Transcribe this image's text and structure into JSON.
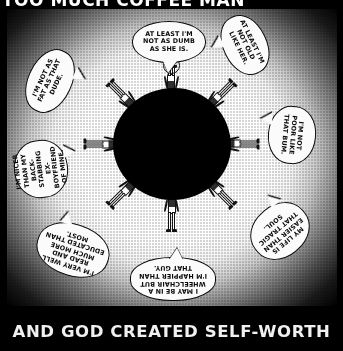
{
  "comic": {
    "title": "TOO MUCH COFFEE MAN",
    "byline": "BY SHANNON WHEELER",
    "caption": "AND GOD CREATED SELF-WORTH",
    "colors": {
      "ink": "#0a0a0a",
      "paper": "#fbfbfb",
      "background": "#000000",
      "glow": "#ffffff"
    }
  },
  "balloons": [
    {
      "id": "top",
      "position": "top-center",
      "text": "AT LEAST I'M NOT AS DUMB AS SHE IS.",
      "emphasis": "DUMB",
      "rotation_deg": 0
    },
    {
      "id": "topright",
      "position": "top-right",
      "text": "AT LEAST I'M NOT OLD LIKE HER.",
      "emphasis": "OLD",
      "rotation_deg": 64
    },
    {
      "id": "right",
      "position": "right",
      "text": "I'M NOT POOR LIKE THAT BUM.",
      "emphasis": "POOR",
      "rotation_deg": 95
    },
    {
      "id": "bottomright",
      "position": "bottom-right",
      "text": "MY LIFE IS EASIER THAN THAT TRAGIC SOUL.",
      "emphasis": "EASIER",
      "rotation_deg": 140
    },
    {
      "id": "bottom",
      "position": "bottom-center",
      "text": "I MAY BE IN A WHEELCHAIR BUT I'M HAPPIER THAN THAT GUY.",
      "emphasis": "HAPPIER",
      "rotation_deg": 180
    },
    {
      "id": "bottomleft",
      "position": "bottom-left",
      "text": "I'M VERY WELL READ AND MUCH MORE EDUCATED THAN MOST.",
      "emphasis": "EDUCATED",
      "rotation_deg": 198
    },
    {
      "id": "left",
      "position": "left",
      "text": "I'M NICER THAN MY BACK-STABBING EX-BOYFRIEND OF MINE.",
      "emphasis": "NICER",
      "rotation_deg": 263
    },
    {
      "id": "topleft",
      "position": "top-left",
      "text": "I'M NOT AS FAT AS THAT DUDE.",
      "emphasis": "FAT",
      "rotation_deg": 295
    }
  ],
  "figures": {
    "count": 8,
    "arrangement": "radial-around-central-void",
    "rotations_deg": [
      0,
      45,
      90,
      135,
      180,
      225,
      270,
      315
    ]
  }
}
